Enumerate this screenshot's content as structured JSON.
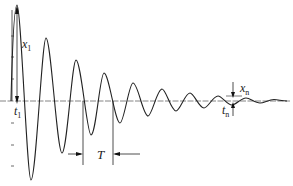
{
  "diagram": {
    "type": "damped-oscillation-waveform",
    "labels": {
      "x1": {
        "main": "x",
        "sub": "1"
      },
      "t1": {
        "main": "t",
        "sub": "1"
      },
      "xn": {
        "main": "x",
        "sub": "n"
      },
      "tn": {
        "main": "t",
        "sub": "n"
      },
      "period": "T"
    },
    "colors": {
      "curve": "#222222",
      "axis": "#555555",
      "background": "#ffffff"
    }
  }
}
